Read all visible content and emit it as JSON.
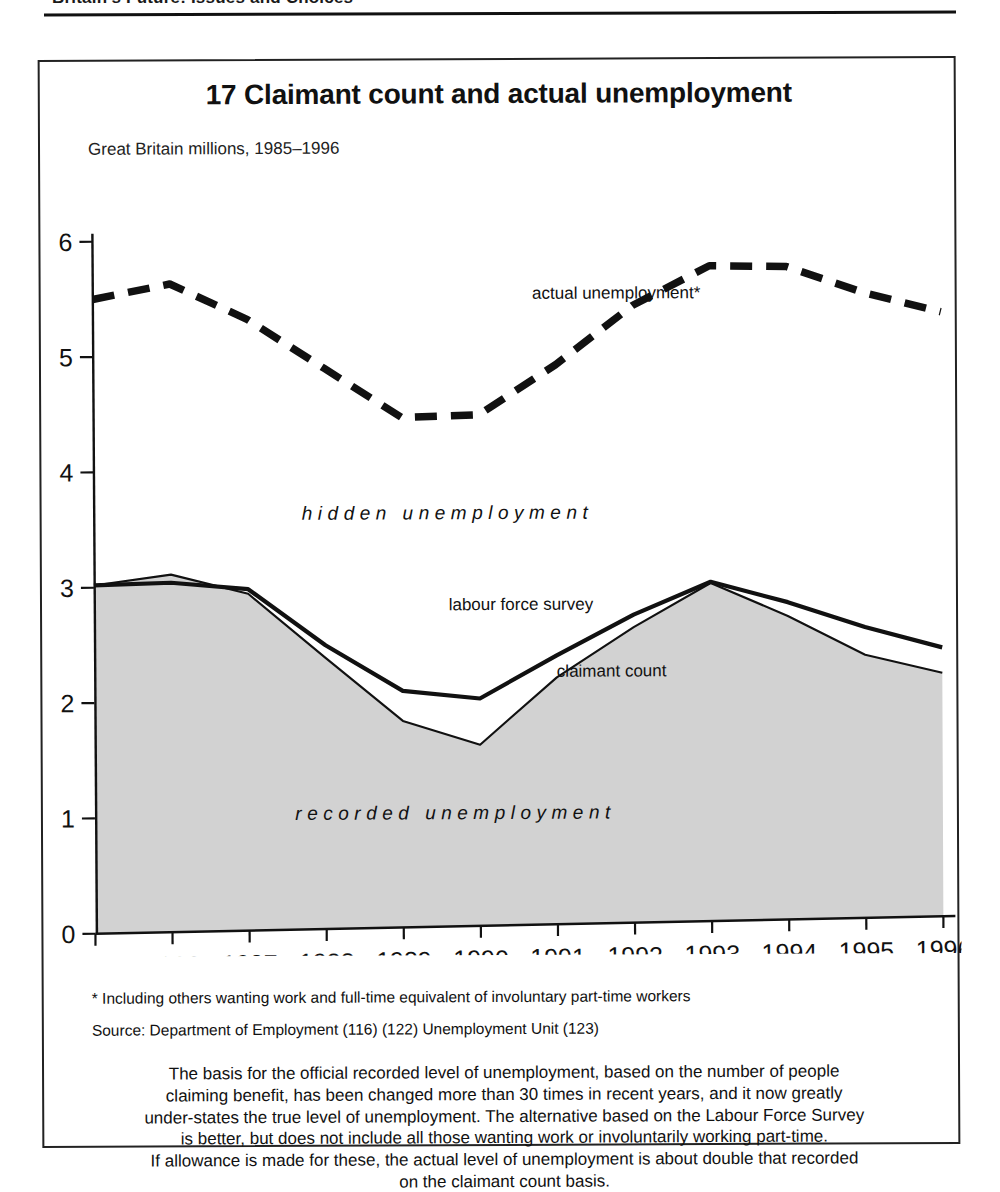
{
  "page_header": {
    "running_head": "Britain's Future: Issues and Choices"
  },
  "figure": {
    "title": "17 Claimant count and actual unemployment",
    "subtitle": "Great Britain millions, 1985–1996",
    "footnote": "* Including others wanting work and full-time equivalent of involuntary part-time workers",
    "source": "Source: Department of Employment (116) (122) Unemployment Unit (123)",
    "caption_lines": [
      "The basis for the official recorded level of unemployment, based on the number of people",
      "claiming benefit, has been changed more than 30 times in recent years, and it now greatly",
      "under-states the true level of unemployment. The alternative based on the Labour Force Survey",
      "is better, but does not include all those wanting work or involuntarily working part-time.",
      "If allowance is made for these, the actual level of unemployment is about double that recorded",
      "on the claimant count basis."
    ],
    "band_labels": {
      "hidden": "hidden unemployment",
      "recorded": "recorded unemployment"
    },
    "series_labels": {
      "actual": "actual unemployment*",
      "lfs": "labour force survey",
      "claimant": "claimant count"
    },
    "colors": {
      "ink": "#111111",
      "area_fill": "#d2d2d2",
      "frame": "#222222"
    }
  },
  "chart_data": {
    "type": "line",
    "title": "17 Claimant count and actual unemployment",
    "subtitle": "Great Britain millions, 1985–1996",
    "xlabel": "",
    "ylabel": "millions",
    "ylim": [
      0,
      6
    ],
    "xlim": [
      1985,
      1996
    ],
    "yticks": [
      0,
      1,
      2,
      3,
      4,
      5,
      6
    ],
    "xticks": [
      1985,
      1986,
      1987,
      1988,
      1989,
      1990,
      1991,
      1992,
      1993,
      1994,
      1995,
      1996
    ],
    "grid": false,
    "legend_position": "inline-annotations",
    "x": [
      1985,
      1986,
      1987,
      1988,
      1989,
      1990,
      1991,
      1992,
      1993,
      1994,
      1995,
      1996
    ],
    "series": [
      {
        "name": "actual unemployment*",
        "style": "dashed",
        "values": [
          5.5,
          5.62,
          5.3,
          4.86,
          4.42,
          4.43,
          4.85,
          5.35,
          5.68,
          5.66,
          5.42,
          5.24
        ]
      },
      {
        "name": "labour force survey",
        "style": "solid-thick",
        "values": [
          3.02,
          3.03,
          2.96,
          2.46,
          2.05,
          1.97,
          2.33,
          2.67,
          2.94,
          2.75,
          2.52,
          2.33
        ]
      },
      {
        "name": "claimant count",
        "style": "solid-thin-filled",
        "values": [
          3.02,
          3.1,
          2.92,
          2.35,
          1.79,
          1.57,
          2.14,
          2.56,
          2.93,
          2.63,
          2.28,
          2.11
        ]
      }
    ],
    "annotations": [
      {
        "text": "hidden unemployment",
        "approx_x": 1988.3,
        "approx_y": 3.55
      },
      {
        "text": "recorded unemployment",
        "approx_x": 1988.5,
        "approx_y": 0.95
      },
      {
        "text": "actual unemployment*",
        "approx_x": 1991.0,
        "approx_y": 5.42
      },
      {
        "text": "labour force survey",
        "approx_x": 1990.5,
        "approx_y": 2.72
      },
      {
        "text": "claimant count",
        "approx_x": 1991.6,
        "approx_y": 2.15
      }
    ]
  }
}
